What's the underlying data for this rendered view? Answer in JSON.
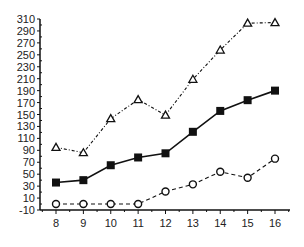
{
  "chart_data": {
    "type": "line",
    "title": "",
    "xlabel": "",
    "ylabel": "",
    "x": [
      8,
      9,
      10,
      11,
      12,
      13,
      14,
      15,
      16
    ],
    "xlim": [
      7.5,
      16.5
    ],
    "ylim": [
      -10,
      310
    ],
    "yticks": [
      -10,
      10,
      30,
      50,
      70,
      90,
      110,
      130,
      150,
      170,
      190,
      210,
      230,
      250,
      270,
      290,
      310
    ],
    "xticks": [
      8,
      9,
      10,
      11,
      12,
      13,
      14,
      15,
      16
    ],
    "grid": false,
    "legend": null,
    "series": [
      {
        "name": "triangle-series",
        "marker": "open-triangle",
        "line": "dash-dot",
        "values": [
          95,
          86,
          143,
          175,
          149,
          209,
          258,
          303,
          304
        ]
      },
      {
        "name": "square-series",
        "marker": "filled-square",
        "line": "solid",
        "values": [
          36,
          40,
          65,
          78,
          85,
          121,
          156,
          174,
          190
        ]
      },
      {
        "name": "circle-series",
        "marker": "open-circle",
        "line": "dashed",
        "values": [
          0,
          0,
          0,
          0,
          21,
          33,
          54,
          44,
          76
        ]
      }
    ]
  }
}
